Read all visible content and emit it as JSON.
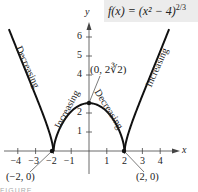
{
  "chart_data": {
    "type": "line",
    "function": "f(x) = (x^2 - 4)^(2/3)",
    "xlabel": "x",
    "ylabel": "y",
    "xlim": [
      -4.6,
      5.0
    ],
    "ylim": [
      0,
      7
    ],
    "x_ticks": [
      -4,
      -3,
      -2,
      -1,
      1,
      2,
      3,
      4
    ],
    "y_ticks": [
      1,
      2,
      4,
      5,
      6
    ],
    "grid": false,
    "legend": "none",
    "series": [
      {
        "name": "f(x)",
        "x": [
          -4.5,
          -4,
          -3.5,
          -3,
          -2.5,
          -2,
          -1.5,
          -1,
          -0.5,
          0,
          0.5,
          1,
          1.5,
          2,
          2.5,
          3,
          3.5,
          4,
          4.5
        ],
        "y": [
          6.42,
          5.24,
          4.17,
          2.92,
          1.72,
          0,
          1.56,
          2.08,
          2.38,
          2.52,
          2.38,
          2.08,
          1.56,
          0,
          1.72,
          2.92,
          4.17,
          5.24,
          6.42
        ]
      }
    ],
    "points": [
      {
        "x": -2,
        "y": 0,
        "label": "(−2, 0)"
      },
      {
        "x": 0,
        "y": 2.52,
        "label": "(0, 2∛2)"
      },
      {
        "x": 2,
        "y": 0,
        "label": "(2, 0)"
      }
    ],
    "annotations": [
      {
        "text": "Decreasing",
        "interval": "(-∞, -2)"
      },
      {
        "text": "Increasing",
        "interval": "(-2, 0)"
      },
      {
        "text": "Decreasing",
        "interval": "(0, 2)"
      },
      {
        "text": "Increasing",
        "interval": "(2, ∞)"
      }
    ]
  },
  "formula": {
    "main": "f(x) = (x² − 4)",
    "exponent": "2/3"
  },
  "axis": {
    "x_label": "x",
    "y_label": "y",
    "x_tick_labels": [
      "−4",
      "−3",
      "−2",
      "−1",
      "1",
      "2",
      "3",
      "4"
    ],
    "y_tick_labels": [
      "6",
      "5",
      "4",
      "2",
      "1"
    ]
  },
  "labels": {
    "left_outer": "Decreasing",
    "left_inner": "Increasing",
    "right_inner": "Decreasing",
    "right_outer": "Increasing",
    "peak_point": "(0, 2∛2)",
    "left_cusp": "(−2, 0)",
    "right_cusp": "(2, 0)"
  },
  "caption": "FIGURE"
}
